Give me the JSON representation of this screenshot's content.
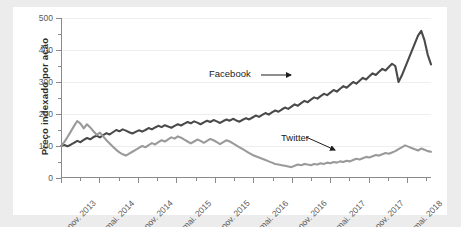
{
  "figure": {
    "background_color": "#ececed",
    "panel_color": "#ffffff"
  },
  "axes": {
    "ylabel": "Preço indexado por ação",
    "ytick_labels": [
      "0",
      "100",
      "200",
      "300",
      "400",
      "500"
    ],
    "xtick_labels": [
      "nov. 2013",
      "mai. 2014",
      "nov. 2014",
      "mai. 2015",
      "nov. 2015",
      "mai. 2016",
      "nov. 2016",
      "mai. 2017",
      "nov. 2017",
      "mai. 2018"
    ]
  },
  "annotations": {
    "facebook": "Facebook",
    "twitter": "Twitter"
  },
  "chart_data": {
    "type": "line",
    "title": "",
    "xlabel": "",
    "ylabel": "Preço indexado por ação",
    "ylim": [
      0,
      500
    ],
    "ytick_values": [
      0,
      100,
      200,
      300,
      400,
      500
    ],
    "y_minor_step": 50,
    "grid": true,
    "legend_position": "inline-annotations",
    "x_tick_labels": [
      "nov. 2013",
      "mai. 2014",
      "nov. 2014",
      "mai. 2015",
      "nov. 2015",
      "mai. 2016",
      "nov. 2016",
      "mai. 2017",
      "nov. 2017",
      "mai. 2018"
    ],
    "x_index_range": [
      0,
      114
    ],
    "series": [
      {
        "name": "Facebook",
        "color": "#4a4a4a",
        "values": [
          100,
          103,
          99,
          104,
          110,
          116,
          112,
          119,
          125,
          121,
          128,
          132,
          127,
          134,
          140,
          136,
          143,
          150,
          146,
          152,
          148,
          143,
          139,
          144,
          149,
          145,
          150,
          156,
          152,
          158,
          163,
          159,
          165,
          161,
          157,
          163,
          168,
          164,
          170,
          175,
          171,
          177,
          173,
          168,
          174,
          179,
          175,
          181,
          177,
          172,
          178,
          183,
          179,
          185,
          180,
          176,
          182,
          187,
          183,
          189,
          195,
          191,
          197,
          203,
          198,
          205,
          211,
          207,
          214,
          220,
          216,
          223,
          230,
          226,
          234,
          241,
          237,
          245,
          252,
          248,
          256,
          263,
          259,
          267,
          275,
          270,
          279,
          287,
          282,
          291,
          300,
          295,
          304,
          313,
          308,
          318,
          327,
          322,
          332,
          341,
          336,
          347,
          357,
          350,
          300,
          320,
          345,
          370,
          395,
          420,
          445,
          460,
          430,
          385,
          355
        ]
      },
      {
        "name": "Twitter",
        "color": "#9a9a9a",
        "values": [
          100,
          112,
          128,
          145,
          162,
          178,
          170,
          155,
          168,
          158,
          146,
          135,
          142,
          130,
          118,
          108,
          98,
          88,
          80,
          74,
          70,
          76,
          82,
          88,
          94,
          100,
          96,
          103,
          109,
          105,
          112,
          118,
          114,
          121,
          127,
          123,
          130,
          126,
          120,
          114,
          108,
          114,
          120,
          116,
          110,
          116,
          122,
          118,
          112,
          106,
          112,
          118,
          114,
          108,
          102,
          96,
          90,
          84,
          78,
          72,
          68,
          64,
          60,
          56,
          52,
          48,
          44,
          42,
          40,
          38,
          36,
          34,
          38,
          42,
          40,
          44,
          42,
          40,
          44,
          42,
          46,
          44,
          48,
          46,
          50,
          48,
          52,
          50,
          54,
          52,
          56,
          60,
          58,
          62,
          66,
          64,
          68,
          72,
          70,
          74,
          78,
          76,
          80,
          84,
          90,
          96,
          102,
          98,
          94,
          90,
          86,
          92,
          88,
          84,
          82
        ]
      }
    ]
  }
}
